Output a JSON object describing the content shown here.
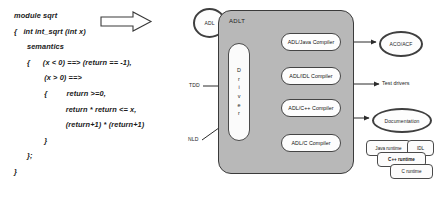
{
  "source_code": {
    "lines": [
      "module sqrt",
      "{   int int_sqrt (int x)",
      "      semantics",
      "      {      (x < 0) ==> (return == -1),",
      "              (x > 0) ==>",
      "              {         return >=0,",
      "                        return * return <= x,",
      "                        (return+1) * (return+1)",
      "              }",
      "      };",
      "}"
    ]
  },
  "inputs": {
    "adl_label": "ADL",
    "tdd_label": "TDD",
    "nld_label": "NLD"
  },
  "toolkit": {
    "title": "ADLT",
    "driver_label": "Driver",
    "driver_letters": [
      "D",
      "r",
      "i",
      "v",
      "e",
      "r"
    ],
    "compilers": [
      {
        "label": "ADL/Java Compiler"
      },
      {
        "label": "ADL/IDL Compiler"
      },
      {
        "label": "ADL/C++ Compiler"
      },
      {
        "label": "ADL/C Compiler"
      }
    ]
  },
  "outputs": {
    "aco_acf": "ACO/ACF",
    "test_drivers": "Test drivers",
    "documentation": "Documentation",
    "runtimes": [
      {
        "label": "Java runtime"
      },
      {
        "label": "IDL"
      },
      {
        "label": "C++ runtime"
      },
      {
        "label": "C runtime"
      }
    ]
  },
  "colors": {
    "toolkit_fill": "#b8b8b8",
    "node_fill": "#fdfdfd",
    "stroke": "#3a3a3a",
    "text": "#1c1c1c"
  }
}
